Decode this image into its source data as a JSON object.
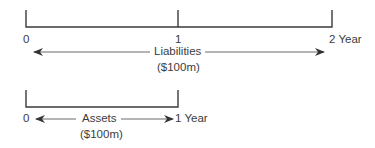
{
  "diagram": {
    "liabilities_timeline": {
      "ticks": [
        "0",
        "1",
        "2 Year"
      ],
      "label": "Liabilities",
      "amount": "($100m)"
    },
    "assets_timeline": {
      "start": "0",
      "end": "1 Year",
      "label": "Assets",
      "amount": "($100m)"
    },
    "colors": {
      "line": "#3a3a3a",
      "arrow": "#5a5a5a",
      "text": "#3c3c3c"
    }
  }
}
